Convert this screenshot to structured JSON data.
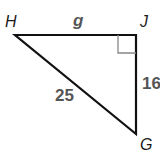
{
  "diagram": {
    "type": "right-triangle",
    "vertices": {
      "H": {
        "label": "H",
        "x": 15,
        "y": 35
      },
      "J": {
        "label": "J",
        "x": 136,
        "y": 35
      },
      "G": {
        "label": "G",
        "x": 136,
        "y": 134
      }
    },
    "sides": {
      "HJ": {
        "label": "g"
      },
      "JG": {
        "label": "16"
      },
      "HG": {
        "label": "25"
      }
    },
    "right_angle_at": "J",
    "colors": {
      "line": "#111111",
      "right_angle_mark": "#888888",
      "side_label": "#555555",
      "vertex_label": "#1a1a1a"
    }
  }
}
